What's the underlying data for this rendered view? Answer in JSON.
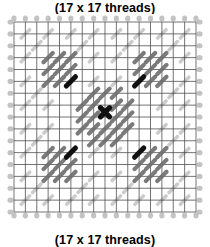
{
  "figure": {
    "title_top": "(17 x 17 threads)",
    "title_bottom": "(17 x 17 threads)"
  },
  "chart_data": {
    "type": "diagram",
    "title": "(17 x 17 threads)",
    "subtitle": "(17 x 17 threads)",
    "xlabel": "",
    "ylabel": "",
    "grid": {
      "threads_x": 17,
      "threads_y": 17,
      "cells_x": 16,
      "cells_y": 16,
      "show_grid": true,
      "grid_color": "#4a4a4a",
      "edge_tick_color": "#b9b9b9"
    },
    "colors": {
      "accent_dark": "#101010",
      "stitch_mid": "#6f6f6f",
      "stitch_light": "#c9c9c9",
      "background": "#ffffff",
      "grid": "#4a4a4a"
    },
    "legend": [],
    "motifs": [
      {
        "name": "top-left-cluster",
        "center_cell": [
          4,
          4
        ],
        "kind": "3x3-diagonal-stitch-block",
        "stitch_count": 9,
        "accent_stitch_cell": [
          5,
          5
        ],
        "accent_color": "#101010",
        "stitch_color": "#6f6f6f"
      },
      {
        "name": "top-right-cluster",
        "center_cell": [
          12,
          4
        ],
        "kind": "3x3-diagonal-stitch-block",
        "stitch_count": 9,
        "accent_stitch_cell": [
          11,
          5
        ],
        "accent_color": "#101010",
        "stitch_color": "#6f6f6f"
      },
      {
        "name": "bottom-left-cluster",
        "center_cell": [
          4,
          12
        ],
        "kind": "3x3-diagonal-stitch-block",
        "stitch_count": 9,
        "accent_stitch_cell": [
          5,
          11
        ],
        "accent_color": "#101010",
        "stitch_color": "#6f6f6f"
      },
      {
        "name": "bottom-right-cluster",
        "center_cell": [
          12,
          12
        ],
        "kind": "3x3-diagonal-stitch-block",
        "stitch_count": 9,
        "accent_stitch_cell": [
          11,
          11
        ],
        "accent_color": "#101010",
        "stitch_color": "#6f6f6f"
      },
      {
        "name": "center-rosette",
        "center_cell": [
          8,
          8
        ],
        "kind": "diamond-rosette",
        "stitch_count": 21,
        "accent_stitch_cell": [
          8,
          8
        ],
        "accent_color": "#101010",
        "stitch_color": "#6f6f6f"
      }
    ],
    "stitch_marks": {
      "dark": [
        [
          5.0,
          5.0
        ],
        [
          11.0,
          5.0
        ],
        [
          5.0,
          11.0
        ],
        [
          11.0,
          11.0
        ],
        [
          8.0,
          7.6
        ]
      ],
      "mid": [
        [
          3.0,
          3.0
        ],
        [
          4.0,
          3.0
        ],
        [
          5.0,
          3.0
        ],
        [
          3.0,
          4.0
        ],
        [
          4.0,
          4.0
        ],
        [
          5.0,
          4.0
        ],
        [
          3.0,
          5.0
        ],
        [
          4.0,
          5.0
        ],
        [
          11.0,
          3.0
        ],
        [
          12.0,
          3.0
        ],
        [
          13.0,
          3.0
        ],
        [
          11.0,
          4.0
        ],
        [
          12.0,
          4.0
        ],
        [
          13.0,
          4.0
        ],
        [
          12.0,
          5.0
        ],
        [
          13.0,
          5.0
        ],
        [
          3.0,
          11.0
        ],
        [
          4.0,
          11.0
        ],
        [
          3.0,
          12.0
        ],
        [
          4.0,
          12.0
        ],
        [
          5.0,
          12.0
        ],
        [
          3.0,
          13.0
        ],
        [
          4.0,
          13.0
        ],
        [
          5.0,
          13.0
        ],
        [
          12.0,
          11.0
        ],
        [
          13.0,
          11.0
        ],
        [
          11.0,
          12.0
        ],
        [
          12.0,
          12.0
        ],
        [
          13.0,
          12.0
        ],
        [
          11.0,
          13.0
        ],
        [
          12.0,
          13.0
        ],
        [
          13.0,
          13.0
        ],
        [
          7.0,
          6.0
        ],
        [
          8.0,
          6.0
        ],
        [
          9.0,
          6.0
        ],
        [
          6.0,
          7.0
        ],
        [
          7.0,
          7.0
        ],
        [
          9.0,
          7.0
        ],
        [
          10.0,
          7.0
        ],
        [
          6.0,
          8.0
        ],
        [
          7.0,
          8.0
        ],
        [
          9.0,
          8.0
        ],
        [
          10.0,
          8.0
        ],
        [
          6.0,
          9.0
        ],
        [
          7.0,
          9.0
        ],
        [
          8.0,
          9.0
        ],
        [
          9.0,
          9.0
        ],
        [
          10.0,
          9.0
        ],
        [
          7.0,
          10.0
        ],
        [
          8.0,
          10.0
        ],
        [
          9.0,
          10.0
        ]
      ],
      "light": [
        [
          1.0,
          1.0
        ],
        [
          3.0,
          1.0
        ],
        [
          5.0,
          1.0
        ],
        [
          7.0,
          1.0
        ],
        [
          9.0,
          1.0
        ],
        [
          11.0,
          1.0
        ],
        [
          13.0,
          1.0
        ],
        [
          15.0,
          1.0
        ],
        [
          1.0,
          3.0
        ],
        [
          7.0,
          3.0
        ],
        [
          9.0,
          3.0
        ],
        [
          15.0,
          3.0
        ],
        [
          1.0,
          5.0
        ],
        [
          7.0,
          5.0
        ],
        [
          9.0,
          5.0
        ],
        [
          15.0,
          5.0
        ],
        [
          1.0,
          7.0
        ],
        [
          3.0,
          7.0
        ],
        [
          13.0,
          7.0
        ],
        [
          15.0,
          7.0
        ],
        [
          1.0,
          9.0
        ],
        [
          3.0,
          9.0
        ],
        [
          13.0,
          9.0
        ],
        [
          15.0,
          9.0
        ],
        [
          1.0,
          11.0
        ],
        [
          7.0,
          11.0
        ],
        [
          9.0,
          11.0
        ],
        [
          15.0,
          11.0
        ],
        [
          1.0,
          13.0
        ],
        [
          7.0,
          13.0
        ],
        [
          9.0,
          13.0
        ],
        [
          15.0,
          13.0
        ],
        [
          1.0,
          15.0
        ],
        [
          3.0,
          15.0
        ],
        [
          5.0,
          15.0
        ],
        [
          7.0,
          15.0
        ],
        [
          9.0,
          15.0
        ],
        [
          11.0,
          15.0
        ],
        [
          13.0,
          15.0
        ],
        [
          15.0,
          15.0
        ],
        [
          2.0,
          2.0
        ],
        [
          14.0,
          2.0
        ],
        [
          2.0,
          14.0
        ],
        [
          14.0,
          14.0
        ],
        [
          6.0,
          2.0
        ],
        [
          10.0,
          2.0
        ],
        [
          2.0,
          6.0
        ],
        [
          14.0,
          6.0
        ],
        [
          2.0,
          10.0
        ],
        [
          14.0,
          10.0
        ],
        [
          6.0,
          14.0
        ],
        [
          10.0,
          14.0
        ]
      ]
    },
    "axis_ranges": {
      "x": [
        0,
        16
      ],
      "y": [
        0,
        16
      ]
    }
  }
}
